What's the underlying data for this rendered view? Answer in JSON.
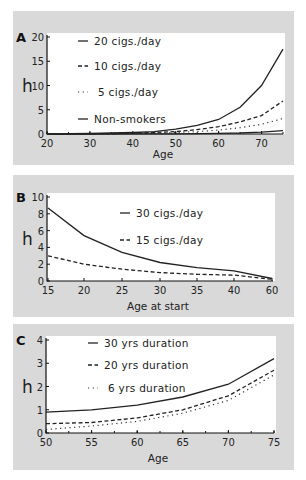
{
  "chart_data": [
    {
      "panel": "A",
      "type": "line",
      "title": "",
      "xlabel": "Age",
      "ylabel": "h",
      "xlim": [
        20,
        75
      ],
      "ylim": [
        0,
        20
      ],
      "xticks": [
        20,
        30,
        40,
        50,
        60,
        70
      ],
      "yticks": [
        0,
        5,
        10,
        15,
        20
      ],
      "legend_position": "upper-left",
      "series": [
        {
          "name": "20 cigs./day",
          "style": "solid",
          "x": [
            20,
            30,
            40,
            45,
            50,
            55,
            60,
            65,
            70,
            75
          ],
          "values": [
            0,
            0.1,
            0.3,
            0.5,
            1.0,
            1.8,
            3.0,
            5.5,
            10.0,
            17.5
          ]
        },
        {
          "name": "10 cigs./day",
          "style": "dashed",
          "x": [
            20,
            30,
            40,
            45,
            50,
            55,
            60,
            65,
            70,
            75
          ],
          "values": [
            0,
            0.05,
            0.15,
            0.3,
            0.5,
            0.9,
            1.5,
            2.5,
            3.8,
            6.8
          ]
        },
        {
          "name": "5 cigs./day",
          "style": "dotted",
          "x": [
            20,
            30,
            40,
            45,
            50,
            55,
            60,
            65,
            70,
            75
          ],
          "values": [
            0,
            0.02,
            0.08,
            0.15,
            0.3,
            0.5,
            0.8,
            1.3,
            2.0,
            3.2
          ]
        },
        {
          "name": "Non-smokers",
          "style": "solid",
          "x": [
            20,
            30,
            40,
            50,
            55,
            60,
            65,
            70,
            75
          ],
          "values": [
            0,
            0,
            0.02,
            0.05,
            0.08,
            0.12,
            0.2,
            0.4,
            0.7
          ]
        }
      ]
    },
    {
      "panel": "B",
      "type": "line",
      "title": "",
      "xlabel": "Age at start",
      "ylabel": "h",
      "xlim": [
        15,
        60
      ],
      "ylim": [
        0,
        10
      ],
      "xticks": [
        15,
        20,
        25,
        30,
        35,
        40,
        60
      ],
      "yticks": [
        0,
        2,
        4,
        6,
        8,
        10
      ],
      "x_axis_note": "non-linear: 40 followed directly by 60",
      "legend_position": "upper-center",
      "series": [
        {
          "name": "30 cigs./day",
          "style": "solid",
          "x": [
            15,
            20,
            25,
            30,
            35,
            40,
            60
          ],
          "values": [
            8.7,
            5.4,
            3.4,
            2.2,
            1.6,
            1.2,
            0.3
          ]
        },
        {
          "name": "15 cigs./day",
          "style": "dashed",
          "x": [
            15,
            20,
            25,
            30,
            35,
            40,
            60
          ],
          "values": [
            3.0,
            2.0,
            1.4,
            1.0,
            0.8,
            0.7,
            0.2
          ]
        }
      ]
    },
    {
      "panel": "C",
      "type": "line",
      "title": "",
      "xlabel": "Age",
      "ylabel": "h",
      "xlim": [
        50,
        75
      ],
      "ylim": [
        0,
        4
      ],
      "xticks": [
        50,
        55,
        60,
        65,
        70,
        75
      ],
      "yticks": [
        0,
        1,
        2,
        3,
        4
      ],
      "legend_position": "upper-left",
      "series": [
        {
          "name": "30 yrs duration",
          "style": "solid",
          "x": [
            50,
            55,
            60,
            65,
            70,
            75
          ],
          "values": [
            0.9,
            1.0,
            1.2,
            1.55,
            2.1,
            3.2
          ]
        },
        {
          "name": "20 yrs duration",
          "style": "dashed",
          "x": [
            50,
            55,
            60,
            65,
            70,
            75
          ],
          "values": [
            0.4,
            0.45,
            0.65,
            1.0,
            1.6,
            2.7
          ]
        },
        {
          "name": "6 yrs duration",
          "style": "dotted",
          "x": [
            50,
            55,
            60,
            65,
            70,
            75
          ],
          "values": [
            0.15,
            0.3,
            0.5,
            0.85,
            1.4,
            2.5
          ]
        }
      ]
    }
  ],
  "layout": {
    "panels": [
      {
        "box": [
          13,
          11,
          281,
          154
        ],
        "plot": [
          47,
          37,
          283,
          134
        ],
        "xlabel_y": 158,
        "legend_x": 78,
        "legend_y": [
          41,
          66,
          92,
          119
        ]
      },
      {
        "box": [
          13,
          175,
          281,
          142
        ],
        "plot": [
          47,
          197,
          273,
          281
        ],
        "xlabel_y": 310,
        "legend_x": 120,
        "legend_y": [
          213,
          240
        ],
        "xpos": {
          "15": 48,
          "20": 84,
          "25": 122,
          "30": 160,
          "35": 197,
          "40": 234,
          "60": 272
        }
      },
      {
        "box": [
          13,
          324,
          281,
          146
        ],
        "plot": [
          46,
          340,
          274,
          433
        ],
        "xlabel_y": 462,
        "legend_x": 88,
        "legend_y": [
          343,
          365,
          388
        ]
      }
    ]
  }
}
